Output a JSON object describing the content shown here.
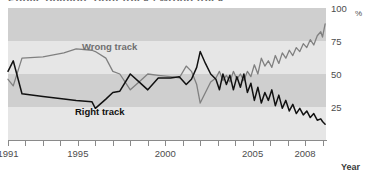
{
  "top_remnant": "Public opinion: right track / wrong track",
  "axes": {
    "y_unit": "%",
    "y_ticks": [
      {
        "value": 100,
        "label": "100"
      },
      {
        "value": 75,
        "label": "75"
      },
      {
        "value": 50,
        "label": "50"
      },
      {
        "value": 25,
        "label": "25"
      }
    ],
    "x_title": "Year",
    "x_tick_years": [
      1991,
      1992,
      1993,
      1994,
      1995,
      1996,
      1997,
      1998,
      1999,
      2000,
      2001,
      2002,
      2003,
      2004,
      2005,
      2006,
      2007,
      2008,
      2009
    ],
    "x_tick_labels": [
      {
        "year": 1991,
        "label": "1991"
      },
      {
        "year": 1995,
        "label": "1995"
      },
      {
        "year": 2000,
        "label": "2000"
      },
      {
        "year": 2005,
        "label": "2005"
      },
      {
        "year": 2008,
        "label": "2008"
      }
    ]
  },
  "legend": {
    "wrong_label": "Wrong track",
    "right_label": "Right track"
  },
  "colors": {
    "wrong_track_line": "#808080",
    "right_track_line": "#111111",
    "band_dark": "#cfcfcf",
    "band_light": "#e6e6e6",
    "axis": "#8a8a8a",
    "text": "#4d4d4d"
  },
  "chart_data": {
    "type": "line",
    "title": "",
    "subtitle": "",
    "xlabel": "Year",
    "ylabel": "%",
    "xlim": [
      1991,
      2009.2
    ],
    "ylim": [
      0,
      100
    ],
    "grid": "horizontal-bands",
    "legend_position": "inline-annotations",
    "series": [
      {
        "name": "Wrong track",
        "color": "#808080",
        "points": [
          [
            1991.0,
            46
          ],
          [
            1991.3,
            41
          ],
          [
            1991.8,
            62
          ],
          [
            1993.0,
            63
          ],
          [
            1994.2,
            66
          ],
          [
            1994.9,
            69
          ],
          [
            1995.8,
            68
          ],
          [
            1996.0,
            67
          ],
          [
            1996.6,
            62
          ],
          [
            1997.0,
            52
          ],
          [
            1997.4,
            50
          ],
          [
            1998.0,
            38
          ],
          [
            1998.5,
            44
          ],
          [
            1999.0,
            50
          ],
          [
            1999.6,
            49
          ],
          [
            2000.3,
            48
          ],
          [
            2000.8,
            47
          ],
          [
            2001.2,
            56
          ],
          [
            2001.5,
            52
          ],
          [
            2001.8,
            42
          ],
          [
            2002.0,
            28
          ],
          [
            2002.3,
            36
          ],
          [
            2002.6,
            44
          ],
          [
            2002.9,
            47
          ],
          [
            2003.1,
            52
          ],
          [
            2003.3,
            45
          ],
          [
            2003.5,
            49
          ],
          [
            2003.7,
            44
          ],
          [
            2003.9,
            52
          ],
          [
            2004.1,
            46
          ],
          [
            2004.3,
            50
          ],
          [
            2004.5,
            45
          ],
          [
            2004.7,
            52
          ],
          [
            2004.9,
            48
          ],
          [
            2005.1,
            57
          ],
          [
            2005.3,
            50
          ],
          [
            2005.5,
            62
          ],
          [
            2005.7,
            56
          ],
          [
            2005.9,
            60
          ],
          [
            2006.1,
            55
          ],
          [
            2006.3,
            64
          ],
          [
            2006.5,
            58
          ],
          [
            2006.7,
            66
          ],
          [
            2006.9,
            62
          ],
          [
            2007.1,
            68
          ],
          [
            2007.3,
            64
          ],
          [
            2007.5,
            70
          ],
          [
            2007.7,
            67
          ],
          [
            2007.9,
            73
          ],
          [
            2008.1,
            70
          ],
          [
            2008.3,
            76
          ],
          [
            2008.5,
            72
          ],
          [
            2008.7,
            79
          ],
          [
            2008.9,
            82
          ],
          [
            2009.0,
            78
          ],
          [
            2009.15,
            88
          ]
        ]
      },
      {
        "name": "Right track",
        "color": "#111111",
        "points": [
          [
            1991.0,
            52
          ],
          [
            1991.3,
            60
          ],
          [
            1991.8,
            35
          ],
          [
            1993.0,
            33
          ],
          [
            1994.2,
            31
          ],
          [
            1994.9,
            30
          ],
          [
            1995.8,
            29
          ],
          [
            1996.0,
            24
          ],
          [
            1996.6,
            31
          ],
          [
            1997.0,
            36
          ],
          [
            1997.4,
            37
          ],
          [
            1998.0,
            50
          ],
          [
            1998.5,
            44
          ],
          [
            1999.0,
            38
          ],
          [
            1999.6,
            47
          ],
          [
            2000.3,
            47
          ],
          [
            2000.8,
            48
          ],
          [
            2001.2,
            42
          ],
          [
            2001.5,
            46
          ],
          [
            2001.8,
            55
          ],
          [
            2002.0,
            67
          ],
          [
            2002.3,
            58
          ],
          [
            2002.6,
            50
          ],
          [
            2002.9,
            46
          ],
          [
            2003.1,
            38
          ],
          [
            2003.3,
            50
          ],
          [
            2003.5,
            42
          ],
          [
            2003.7,
            49
          ],
          [
            2003.9,
            38
          ],
          [
            2004.1,
            48
          ],
          [
            2004.3,
            40
          ],
          [
            2004.5,
            50
          ],
          [
            2004.7,
            36
          ],
          [
            2004.9,
            43
          ],
          [
            2005.1,
            30
          ],
          [
            2005.3,
            40
          ],
          [
            2005.5,
            28
          ],
          [
            2005.7,
            36
          ],
          [
            2005.9,
            30
          ],
          [
            2006.1,
            38
          ],
          [
            2006.3,
            26
          ],
          [
            2006.5,
            34
          ],
          [
            2006.7,
            24
          ],
          [
            2006.9,
            30
          ],
          [
            2007.1,
            22
          ],
          [
            2007.3,
            27
          ],
          [
            2007.5,
            20
          ],
          [
            2007.7,
            24
          ],
          [
            2007.9,
            19
          ],
          [
            2008.1,
            22
          ],
          [
            2008.3,
            17
          ],
          [
            2008.5,
            20
          ],
          [
            2008.7,
            15
          ],
          [
            2008.9,
            16
          ],
          [
            2009.0,
            14
          ],
          [
            2009.15,
            12
          ]
        ]
      }
    ]
  }
}
